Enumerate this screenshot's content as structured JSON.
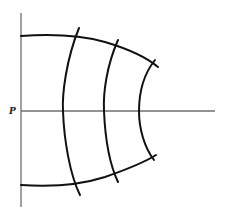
{
  "diagram": {
    "point_label": "P",
    "colors": {
      "axis": "#6e6e6e",
      "curve": "#111111",
      "background": "#ffffff"
    },
    "elements": {
      "vertical_axis": "vertical line on left",
      "horizontal_axis": "horizontal line through P",
      "boundary_curves": [
        "top boundary curve",
        "bottom boundary curve"
      ],
      "arcs": [
        "arc 1",
        "arc 2",
        "arc 3"
      ]
    }
  }
}
